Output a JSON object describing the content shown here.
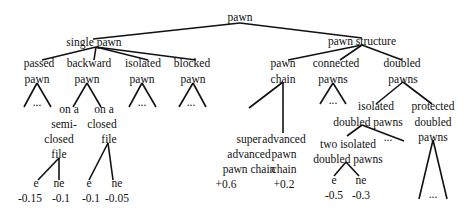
{
  "diagram": {
    "nodes": {
      "root": {
        "lines": [
          "pawn"
        ]
      },
      "single_pawn": {
        "lines": [
          "single pawn"
        ]
      },
      "pawn_structure": {
        "lines": [
          "pawn structure"
        ]
      },
      "passed_pawn": {
        "lines": [
          "passed",
          "pawn"
        ]
      },
      "backward_pawn": {
        "lines": [
          "backward",
          "pawn"
        ]
      },
      "isolated_pawn": {
        "lines": [
          "isolated",
          "pawn"
        ]
      },
      "blocked_pawn": {
        "lines": [
          "blocked",
          "pawn"
        ]
      },
      "semi_closed": {
        "lines": [
          "on a",
          "semi-",
          "closed",
          "file"
        ]
      },
      "closed": {
        "lines": [
          "on a",
          "closed",
          "file"
        ]
      },
      "semi_e": {
        "lines": [
          "e",
          "-0.15"
        ]
      },
      "semi_ne": {
        "lines": [
          "ne",
          "-0.1"
        ]
      },
      "closed_e": {
        "lines": [
          "e",
          "-0.1"
        ]
      },
      "closed_ne": {
        "lines": [
          "ne",
          "-0.05"
        ]
      },
      "pawn_chain": {
        "lines": [
          "pawn",
          "chain"
        ]
      },
      "connected_pawns": {
        "lines": [
          "connected",
          "pawns"
        ]
      },
      "doubled_pawns": {
        "lines": [
          "doubled",
          "pawns"
        ]
      },
      "super_advanced": {
        "lines": [
          "super",
          "advanced",
          "pawn chain",
          "+0.6"
        ]
      },
      "advanced": {
        "lines": [
          "advanced",
          "pawn",
          "chain",
          "+0.2"
        ]
      },
      "isolated_doubled": {
        "lines": [
          "isolated",
          "doubled pawns"
        ]
      },
      "protected_doubled": {
        "lines": [
          "protected",
          "doubled",
          "pawns"
        ]
      },
      "two_isolated": {
        "lines": [
          "two isolated",
          "doubled pawns"
        ]
      },
      "two_e": {
        "lines": [
          "e",
          "-0.5"
        ]
      },
      "two_ne": {
        "lines": [
          "ne",
          "-0.3"
        ]
      }
    },
    "ellipsis": "..."
  }
}
